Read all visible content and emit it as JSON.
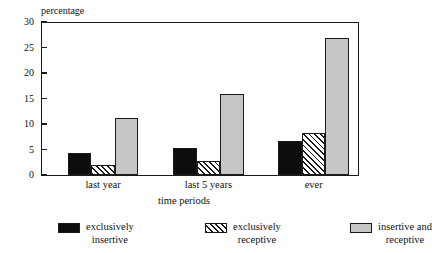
{
  "chart_data": {
    "type": "bar",
    "title": "",
    "subtitle": "",
    "xlabel": "time periods",
    "ylabel": "percentage",
    "categories": [
      "last year",
      "last 5 years",
      "ever"
    ],
    "series": [
      {
        "name": "exclusively insertive",
        "values": [
          4.3,
          5.2,
          6.6
        ],
        "color": "#0d0d0d",
        "fill": "solid"
      },
      {
        "name": "exclusively receptive",
        "values": [
          1.9,
          2.7,
          8.2
        ],
        "color": "#ffffff",
        "fill": "hatch"
      },
      {
        "name": "insertive and receptive",
        "values": [
          11.2,
          15.8,
          26.8
        ],
        "color": "#c6c6c6",
        "fill": "light"
      }
    ],
    "ylim": [
      0,
      30
    ],
    "yticks": [
      0,
      5,
      10,
      15,
      20,
      25,
      30
    ],
    "ytick_labels": [
      "0",
      "5",
      "10",
      "15",
      "20",
      "25",
      "30"
    ],
    "grid": false,
    "legend_position": "bottom"
  },
  "axes": {
    "y_title": "percentage",
    "x_title": "time periods"
  },
  "legend": {
    "items": [
      {
        "line1": "exclusively",
        "line2": "insertive"
      },
      {
        "line1": "exclusively",
        "line2": "receptive"
      },
      {
        "line1": "insertive and",
        "line2": "receptive"
      }
    ]
  }
}
